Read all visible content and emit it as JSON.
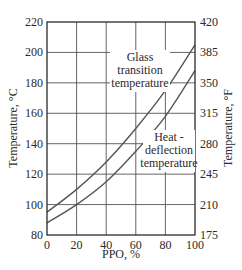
{
  "chart_data": {
    "type": "line",
    "title": "",
    "xlabel": "PPO, %",
    "ylabel": "Temperature, °C",
    "ylabel_right": "Temperature, °F",
    "xlim": [
      0,
      100
    ],
    "ylim": [
      80,
      220
    ],
    "grid": true,
    "legend": "none (inline annotations)",
    "x_ticks": [
      "0",
      "20",
      "40",
      "60",
      "80",
      "100"
    ],
    "y_ticks_left": [
      "80",
      "100",
      "120",
      "140",
      "160",
      "180",
      "200",
      "220"
    ],
    "y_ticks_right": [
      "175",
      "210",
      "245",
      "280",
      "315",
      "350",
      "385",
      "420"
    ],
    "x": [
      0,
      20,
      40,
      60,
      80,
      100
    ],
    "series": [
      {
        "name": "Glass transition temperature",
        "values": [
          95,
          110,
          128,
          150,
          175,
          205
        ]
      },
      {
        "name": "Heat - deflection temperature",
        "values": [
          88,
          100,
          115,
          135,
          158,
          188
        ]
      }
    ],
    "annotations": [
      {
        "lines": [
          "Glass",
          "transition",
          "temperature"
        ],
        "series": "Glass transition temperature"
      },
      {
        "lines": [
          "Heat -",
          "deflection",
          "temperature"
        ],
        "series": "Heat - deflection temperature"
      }
    ]
  },
  "colors": {
    "frame": "#2a2a2a",
    "grid": "#555555",
    "curve": "#555555",
    "text": "#2a2a2a",
    "background": "#ffffff"
  }
}
